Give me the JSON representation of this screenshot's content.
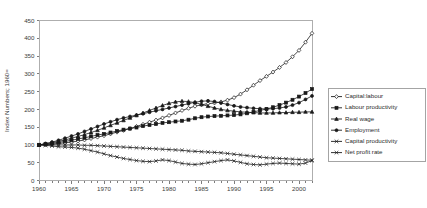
{
  "chart_data": {
    "type": "line",
    "title": "",
    "xlabel": "",
    "ylabel": "Index Numbers; 1960=",
    "xlim": [
      1960,
      2002
    ],
    "ylim": [
      0,
      450
    ],
    "grid": false,
    "legend_position": "right",
    "x_ticks": [
      1960,
      1965,
      1970,
      1975,
      1980,
      1985,
      1990,
      1995,
      2000
    ],
    "y_ticks": [
      0,
      50,
      100,
      150,
      200,
      250,
      300,
      350,
      400,
      450
    ],
    "x": [
      1960,
      1961,
      1962,
      1963,
      1964,
      1965,
      1966,
      1967,
      1968,
      1969,
      1970,
      1971,
      1972,
      1973,
      1974,
      1975,
      1976,
      1977,
      1978,
      1979,
      1980,
      1981,
      1982,
      1983,
      1984,
      1985,
      1986,
      1987,
      1988,
      1989,
      1990,
      1991,
      1992,
      1993,
      1994,
      1995,
      1996,
      1997,
      1998,
      1999,
      2000,
      2001,
      2002
    ],
    "series": [
      {
        "name": "Capital:labour",
        "marker": "diamond",
        "values": [
          100,
          101,
          102,
          104,
          106,
          108,
          111,
          114,
          118,
          122,
          126,
          131,
          136,
          141,
          146,
          152,
          158,
          164,
          170,
          176,
          183,
          190,
          197,
          203,
          209,
          213,
          216,
          218,
          221,
          226,
          233,
          243,
          255,
          268,
          281,
          293,
          305,
          318,
          332,
          348,
          366,
          389,
          414
        ]
      },
      {
        "name": "Labour productivity",
        "marker": "square",
        "values": [
          100,
          102,
          104,
          107,
          110,
          113,
          117,
          120,
          124,
          128,
          131,
          135,
          139,
          143,
          146,
          149,
          153,
          156,
          159,
          162,
          164,
          166,
          168,
          171,
          175,
          178,
          180,
          181,
          182,
          183,
          184,
          186,
          189,
          193,
          197,
          201,
          206,
          212,
          219,
          227,
          236,
          246,
          257
        ]
      },
      {
        "name": "Real wage",
        "marker": "triangle",
        "values": [
          100,
          103,
          106,
          110,
          114,
          119,
          124,
          129,
          135,
          141,
          148,
          155,
          162,
          169,
          176,
          183,
          190,
          197,
          204,
          211,
          217,
          221,
          223,
          222,
          219,
          214,
          209,
          204,
          200,
          197,
          195,
          193,
          192,
          191,
          190,
          190,
          190,
          191,
          191,
          192,
          192,
          193,
          193
        ]
      },
      {
        "name": "Employment",
        "marker": "circle",
        "values": [
          100,
          104,
          108,
          113,
          119,
          125,
          131,
          138,
          145,
          152,
          159,
          165,
          171,
          176,
          180,
          184,
          188,
          192,
          196,
          200,
          204,
          208,
          212,
          216,
          220,
          223,
          224,
          222,
          218,
          214,
          210,
          207,
          205,
          203,
          202,
          201,
          202,
          204,
          207,
          212,
          219,
          228,
          238
        ]
      },
      {
        "name": "Capital productivity",
        "marker": "cross",
        "values": [
          100,
          100,
          100,
          100,
          100,
          100,
          100,
          99,
          99,
          98,
          97,
          96,
          95,
          94,
          93,
          92,
          91,
          90,
          89,
          88,
          87,
          86,
          85,
          83,
          82,
          81,
          80,
          79,
          78,
          76,
          74,
          72,
          70,
          68,
          66,
          64,
          63,
          62,
          61,
          60,
          59,
          58,
          57
        ]
      },
      {
        "name": "Net profit rate",
        "marker": "cross",
        "values": [
          100,
          99,
          97,
          95,
          94,
          93,
          91,
          88,
          84,
          80,
          75,
          70,
          66,
          62,
          59,
          56,
          54,
          53,
          55,
          58,
          56,
          52,
          48,
          46,
          45,
          47,
          50,
          53,
          56,
          58,
          55,
          51,
          47,
          45,
          44,
          46,
          48,
          49,
          48,
          47,
          46,
          49,
          56
        ]
      }
    ]
  },
  "legend": {
    "items": [
      "Capital:labour",
      "Labour productivity",
      "Real wage",
      "Employment",
      "Capital productivity",
      "Net profit rate"
    ]
  }
}
